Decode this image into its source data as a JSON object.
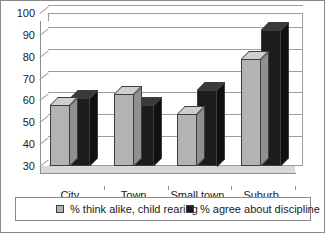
{
  "chart_data": {
    "type": "bar",
    "title": "",
    "subtitle": "",
    "xlabel": "",
    "ylabel": "",
    "categories": [
      "City",
      "Town",
      "Small town",
      "Suburb"
    ],
    "series": [
      {
        "name": "% think alike, child rearing",
        "color": "#b3b3b3",
        "values": [
          58,
          63,
          54,
          79
        ]
      },
      {
        "name": "% agree about discipline",
        "color": "#1c1c1c",
        "values": [
          61,
          58,
          65,
          92
        ]
      }
    ],
    "ylim": [
      30,
      100
    ],
    "ytick_step": 10,
    "yticks": [
      30,
      40,
      50,
      60,
      70,
      80,
      90,
      100
    ],
    "ytick_labels": [
      "30",
      "40",
      "50",
      "60",
      "70",
      "80",
      "90",
      "100"
    ],
    "grid": true,
    "grid_axis": "y",
    "legend_position": "bottom",
    "style": "3d-clustered-column"
  },
  "legend": {
    "entries": [
      {
        "label": "% think alike, child rearing",
        "swatch": "series-1-swatch"
      },
      {
        "label": "% agree about discipline",
        "swatch": "series-2-swatch"
      }
    ]
  }
}
